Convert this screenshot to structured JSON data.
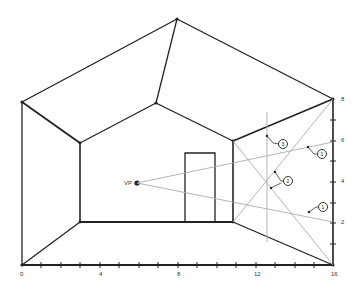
{
  "diagram": {
    "type": "one-point perspective room construction",
    "vanishing_point_label": "VP",
    "x_axis_ticks": [
      "0",
      "4",
      "8",
      "12",
      "16"
    ],
    "y_axis_ticks": [
      "2",
      "4",
      "6",
      "8"
    ],
    "callouts": [
      "3",
      "1",
      "2",
      "1"
    ]
  }
}
